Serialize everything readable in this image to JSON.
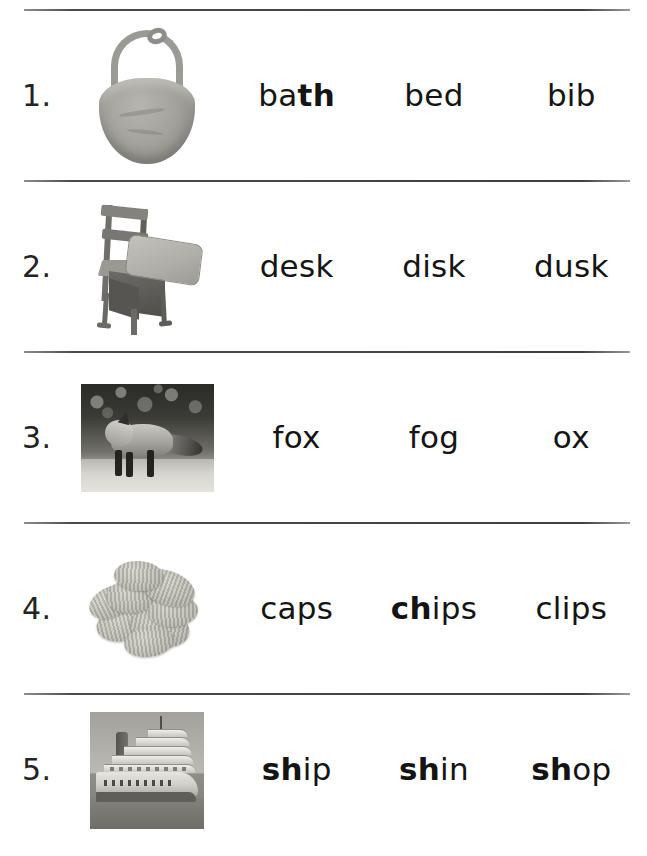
{
  "worksheet": {
    "title": "Phonics Picture-Word Choice Worksheet",
    "column_count": 3,
    "row_count": 5
  },
  "rows": [
    {
      "number": "1.",
      "picture": "bib-photo",
      "picture_alt": "bib",
      "words": [
        {
          "prefix": "ba",
          "bold": "th",
          "suffix": "",
          "full": "bath",
          "bolded": true
        },
        {
          "prefix": "bed",
          "bold": "",
          "suffix": "",
          "full": "bed",
          "bolded": false
        },
        {
          "prefix": "bib",
          "bold": "",
          "suffix": "",
          "full": "bib",
          "bolded": false
        }
      ]
    },
    {
      "number": "2.",
      "picture": "school-desk-photo",
      "picture_alt": "desk",
      "words": [
        {
          "prefix": "desk",
          "bold": "",
          "suffix": "",
          "full": "desk",
          "bolded": false
        },
        {
          "prefix": "disk",
          "bold": "",
          "suffix": "",
          "full": "disk",
          "bolded": false
        },
        {
          "prefix": "dusk",
          "bold": "",
          "suffix": "",
          "full": "dusk",
          "bolded": false
        }
      ]
    },
    {
      "number": "3.",
      "picture": "fox-photo",
      "picture_alt": "fox",
      "words": [
        {
          "prefix": "fox",
          "bold": "",
          "suffix": "",
          "full": "fox",
          "bolded": false
        },
        {
          "prefix": "fog",
          "bold": "",
          "suffix": "",
          "full": "fog",
          "bolded": false
        },
        {
          "prefix": "ox",
          "bold": "",
          "suffix": "",
          "full": "ox",
          "bolded": false
        }
      ]
    },
    {
      "number": "4.",
      "picture": "potato-chips-photo",
      "picture_alt": "chips",
      "words": [
        {
          "prefix": "caps",
          "bold": "",
          "suffix": "",
          "full": "caps",
          "bolded": false
        },
        {
          "prefix": "",
          "bold": "ch",
          "suffix": "ips",
          "full": "chips",
          "bolded": true
        },
        {
          "prefix": "clips",
          "bold": "",
          "suffix": "",
          "full": "clips",
          "bolded": false
        }
      ]
    },
    {
      "number": "5.",
      "picture": "cruise-ship-photo",
      "picture_alt": "ship",
      "words": [
        {
          "prefix": "",
          "bold": "sh",
          "suffix": "ip",
          "full": "ship",
          "bolded": true
        },
        {
          "prefix": "",
          "bold": "sh",
          "suffix": "in",
          "full": "shin",
          "bolded": true
        },
        {
          "prefix": "",
          "bold": "sh",
          "suffix": "op",
          "full": "shop",
          "bolded": true
        }
      ]
    }
  ],
  "colors": {
    "text": "#141414",
    "rule": "#3f3f3f",
    "background": "#ffffff"
  }
}
